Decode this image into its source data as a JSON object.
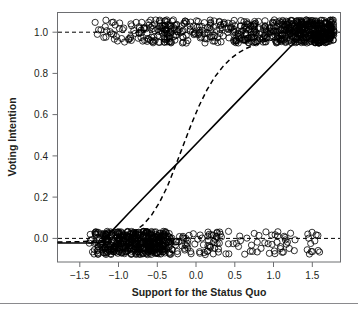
{
  "chart_data": {
    "type": "scatter",
    "title": "",
    "xlabel": "Support for the Status Quo",
    "ylabel": "Voting Intention",
    "xlim": [
      -1.78,
      1.78
    ],
    "ylim": [
      -0.09,
      1.09
    ],
    "xticks": [
      -1.5,
      -1.0,
      -0.5,
      0.0,
      0.5,
      1.0,
      1.5
    ],
    "xticklabels": [
      "−1.5",
      "−1.0",
      "−0.5",
      "0.0",
      "0.5",
      "1.0",
      "1.5"
    ],
    "yticks": [
      0.0,
      0.2,
      0.4,
      0.6,
      0.8,
      1.0
    ],
    "yticklabels": [
      "0.0",
      "0.2",
      "0.4",
      "0.6",
      "0.8",
      "1.0"
    ],
    "grid": false,
    "legend": "none",
    "point_marker": "open-circle",
    "point_color": "#000000",
    "point_radius_px": 3.1,
    "jitter_amplitude_y": 0.055,
    "reference_lines": [
      {
        "name": "y-zero-reference",
        "y": 0.0,
        "style": "dashed",
        "color": "#000000"
      },
      {
        "name": "y-one-reference",
        "y": 1.0,
        "style": "dashed",
        "color": "#000000"
      }
    ],
    "series": [
      {
        "name": "Linear probability fit",
        "type": "line",
        "style": "solid",
        "color": "#000000",
        "x": [
          -1.78,
          -1.55,
          -1.35,
          -1.2,
          -1.1,
          -0.9,
          -0.7,
          -0.5,
          -0.25,
          0.0,
          0.25,
          0.5,
          0.75,
          1.0,
          1.2,
          1.35,
          1.5,
          1.7
        ],
        "y": [
          0.0,
          0.0,
          0.0,
          0.005,
          0.055,
          0.135,
          0.213,
          0.29,
          0.385,
          0.482,
          0.58,
          0.677,
          0.774,
          0.87,
          0.948,
          0.99,
          1.0,
          1.0
        ]
      },
      {
        "name": "Logistic regression fit",
        "type": "line",
        "style": "dashed",
        "color": "#000000",
        "x": [
          -1.78,
          -1.5,
          -1.3,
          -1.15,
          -1.0,
          -0.9,
          -0.8,
          -0.7,
          -0.6,
          -0.5,
          -0.4,
          -0.3,
          -0.2,
          -0.1,
          0.0,
          0.1,
          0.2,
          0.3,
          0.4,
          0.5,
          0.6,
          0.7,
          0.8,
          0.9,
          1.0,
          1.15,
          1.3,
          1.5,
          1.7
        ],
        "y": [
          0.004,
          0.006,
          0.009,
          0.014,
          0.025,
          0.038,
          0.058,
          0.087,
          0.13,
          0.19,
          0.265,
          0.36,
          0.46,
          0.558,
          0.648,
          0.724,
          0.786,
          0.834,
          0.872,
          0.9,
          0.921,
          0.937,
          0.95,
          0.959,
          0.967,
          0.976,
          0.983,
          0.99,
          0.995
        ]
      },
      {
        "name": "Observed responses",
        "type": "scatter",
        "description": "Jittered binary voting intention outcomes plotted against support for the status quo",
        "n_points": 760,
        "clusters": [
          {
            "outcome": 1.0,
            "x_range": [
              -1.25,
              1.7
            ],
            "density": "increasing toward the right, saturated beyond x = 0.5"
          },
          {
            "outcome": 0.0,
            "x_range": [
              -1.4,
              1.55
            ],
            "density": "saturated below x = -0.5, sparse toward the right"
          }
        ]
      }
    ]
  },
  "figure": {
    "background_color": "#ffffff",
    "frame_color": "#6d6e71",
    "axis_text_color": "#231f20",
    "footer_rule_color": "#8a8a8d"
  }
}
